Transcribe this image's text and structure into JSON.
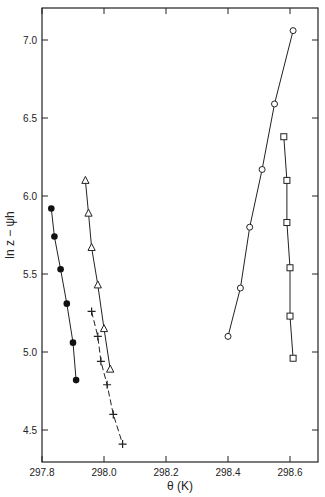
{
  "chart_data": {
    "type": "scatter",
    "title": "",
    "xlabel": "θ (K)",
    "ylabel": "ln z − ψh",
    "xlim": [
      297.8,
      298.7
    ],
    "ylim": [
      4.3,
      7.25
    ],
    "x_ticks": [
      "297.8",
      "298.0",
      "298.2",
      "298.4",
      "298.6"
    ],
    "y_ticks": [
      "4.5",
      "5.0",
      "5.5",
      "6.0",
      "6.5",
      "7.0"
    ],
    "grid": false,
    "legend": null,
    "series": [
      {
        "name": "filled-circles",
        "marker": "filled-circle",
        "line": "solid",
        "x": [
          297.83,
          297.84,
          297.86,
          297.88,
          297.9,
          297.91
        ],
        "y": [
          5.92,
          5.74,
          5.53,
          5.31,
          5.06,
          4.82
        ]
      },
      {
        "name": "triangles",
        "marker": "open-triangle",
        "line": "solid",
        "x": [
          297.94,
          297.95,
          297.96,
          297.98,
          298.0,
          298.02
        ],
        "y": [
          6.1,
          5.89,
          5.67,
          5.43,
          5.15,
          4.89
        ]
      },
      {
        "name": "crosses",
        "marker": "plus",
        "line": "dashed",
        "x": [
          297.96,
          297.98,
          297.99,
          298.01,
          298.03,
          298.06
        ],
        "y": [
          5.26,
          5.1,
          4.94,
          4.79,
          4.6,
          4.41
        ]
      },
      {
        "name": "open-circles",
        "marker": "open-circle",
        "line": "solid",
        "x": [
          298.4,
          298.44,
          298.47,
          298.51,
          298.55,
          298.61
        ],
        "y": [
          5.1,
          5.41,
          5.8,
          6.17,
          6.59,
          7.06
        ]
      },
      {
        "name": "squares",
        "marker": "open-square",
        "line": "solid",
        "x": [
          298.58,
          298.59,
          298.59,
          298.6,
          298.6,
          298.61
        ],
        "y": [
          6.38,
          6.1,
          5.83,
          5.54,
          5.23,
          4.96
        ]
      }
    ]
  }
}
